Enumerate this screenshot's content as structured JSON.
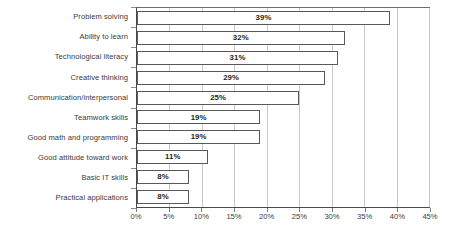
{
  "chart_data": {
    "type": "bar",
    "orientation": "horizontal",
    "title": "",
    "subtitle": "",
    "xlabel": "",
    "ylabel": "",
    "xlim": [
      0,
      45
    ],
    "xtick_step": 5,
    "xticks": [
      "0%",
      "5%",
      "10%",
      "15%",
      "20%",
      "25%",
      "30%",
      "35%",
      "40%",
      "45%"
    ],
    "xtick_values": [
      0,
      5,
      10,
      15,
      20,
      25,
      30,
      35,
      40,
      45
    ],
    "grid": "vertical",
    "legend": "none",
    "value_label_suffix": "%",
    "value_labels_inside": true,
    "categories": [
      "Problem solving",
      "Ability to learn",
      "Technological literacy",
      "Creative thinking",
      "Communication/interpersonal",
      "Teamwork skills",
      "Good math and programming",
      "Good attitude toward work",
      "Basic IT skills",
      "Practical applications"
    ],
    "values": [
      39,
      32,
      31,
      29,
      25,
      19,
      19,
      11,
      8,
      8
    ],
    "value_labels": [
      "39%",
      "32%",
      "31%",
      "29%",
      "25%",
      "19%",
      "19%",
      "11%",
      "8%",
      "8%"
    ],
    "colors": {
      "bar_fill": "#ffffff",
      "bar_border": "#585858",
      "gridline": "#c8c8c8",
      "axis": "#4a4a4a",
      "text": "#3a3a3a",
      "value_text": "#1f1f1f",
      "background": "#ffffff"
    }
  }
}
